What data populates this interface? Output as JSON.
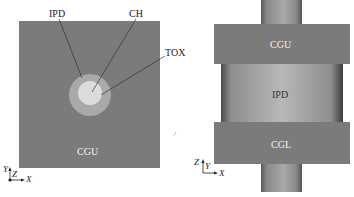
{
  "left_view": {
    "labels": {
      "ipd": "IPD",
      "ch": "CH",
      "tox": "TOX",
      "cgu": "CGU"
    },
    "axes": {
      "vertical": "Y",
      "out_of_plane": "Z",
      "horizontal": "X"
    },
    "colors": {
      "gate": "#7b7b7b",
      "ipd": "#a9a9a9",
      "ch": "#dcdcdc",
      "leader": "#333333"
    }
  },
  "right_view": {
    "labels": {
      "cgu": "CGU",
      "ipd": "IPD",
      "cgl": "CGL"
    },
    "axes": {
      "vertical": "Z",
      "out_of_plane": "Y",
      "horizontal": "X"
    },
    "colors": {
      "gate": "#7b7b7b",
      "cylinder_light": "#b5b5b5",
      "cylinder_dark": "#4a4a4a"
    }
  }
}
